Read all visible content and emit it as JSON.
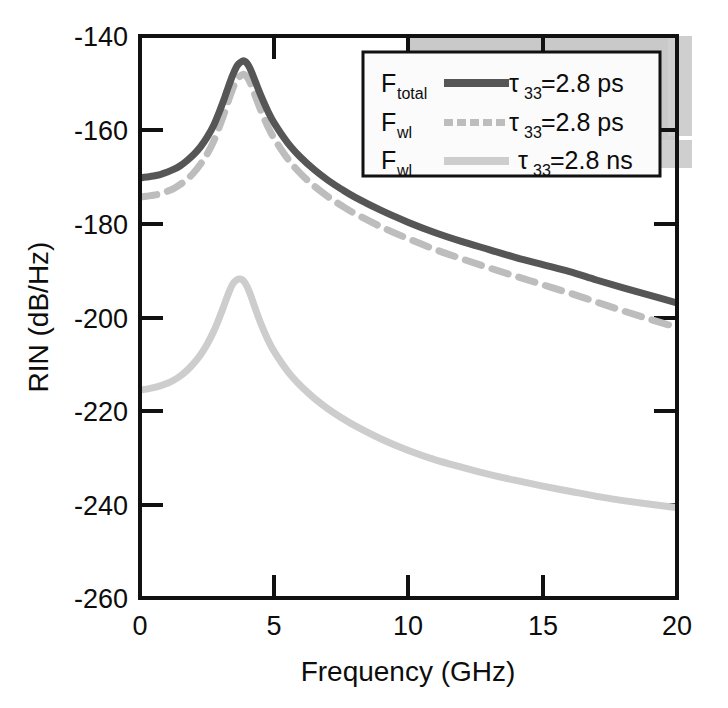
{
  "chart_data": {
    "type": "line",
    "title": "",
    "xlabel": "Frequency (GHz)",
    "ylabel": "RIN (dB/Hz)",
    "xlim": [
      0,
      20
    ],
    "ylim": [
      -260,
      -140
    ],
    "xticks": [
      "0",
      "5",
      "10",
      "15",
      "20"
    ],
    "xtick_values": [
      0,
      5,
      10,
      15,
      20
    ],
    "yticks": [
      "-140",
      "-160",
      "-180",
      "-200",
      "-220",
      "-240",
      "-260"
    ],
    "ytick_values": [
      -140,
      -160,
      -180,
      -200,
      -220,
      -240,
      -260
    ],
    "grid": false,
    "legend_position": "upper-right-inside",
    "series": [
      {
        "name": "F_total, tau33 = 2.8 ps",
        "legend_symbol": "F",
        "legend_subscript": "total",
        "legend_value_prefix": "τ",
        "legend_value_subscript": "33",
        "legend_value": "=2.8 ps",
        "style": "solid",
        "color": "#565656",
        "width": 7,
        "x": [
          0,
          0.25,
          0.5,
          0.75,
          1.0,
          1.25,
          1.5,
          1.75,
          2.0,
          2.25,
          2.5,
          2.75,
          3.0,
          3.15,
          3.3,
          3.45,
          3.6,
          3.7,
          3.8,
          3.87,
          3.95,
          4.05,
          4.15,
          4.3,
          4.5,
          4.75,
          5.0,
          5.5,
          6.0,
          6.5,
          7.0,
          7.5,
          8.0,
          9.0,
          10.0,
          11.0,
          12.0,
          13.0,
          14.0,
          15.0,
          16.0,
          17.0,
          18.0,
          19.0,
          20.0
        ],
        "y": [
          -170.3,
          -170.1,
          -169.9,
          -169.6,
          -169.1,
          -168.5,
          -167.7,
          -166.6,
          -165.3,
          -163.7,
          -161.6,
          -159.0,
          -155.5,
          -153.2,
          -150.7,
          -148.4,
          -146.5,
          -145.8,
          -145.4,
          -145.3,
          -145.6,
          -146.4,
          -147.6,
          -149.8,
          -152.7,
          -155.9,
          -158.6,
          -162.8,
          -166.0,
          -168.6,
          -170.8,
          -172.7,
          -174.4,
          -177.3,
          -179.8,
          -182.0,
          -183.9,
          -185.6,
          -187.3,
          -188.8,
          -190.3,
          -192.1,
          -193.8,
          -195.4,
          -197.0
        ]
      },
      {
        "name": "F_wl, tau33 = 2.8 ps",
        "legend_symbol": "F",
        "legend_subscript": "wl",
        "legend_value_prefix": "τ",
        "legend_value_subscript": "33",
        "legend_value": "=2.8 ps",
        "style": "dashed",
        "color": "#bdbdbd",
        "width": 7,
        "x": [
          0,
          0.25,
          0.5,
          0.75,
          1.0,
          1.25,
          1.5,
          1.75,
          2.0,
          2.25,
          2.5,
          2.75,
          3.0,
          3.15,
          3.3,
          3.45,
          3.6,
          3.7,
          3.8,
          3.87,
          3.95,
          4.05,
          4.15,
          4.3,
          4.5,
          4.75,
          5.0,
          5.5,
          6.0,
          6.5,
          7.0,
          7.5,
          8.0,
          9.0,
          10.0,
          11.0,
          12.0,
          13.0,
          14.0,
          15.0,
          16.0,
          17.0,
          18.0,
          19.0,
          20.0
        ],
        "y": [
          -174.4,
          -174.2,
          -174.0,
          -173.7,
          -173.2,
          -172.6,
          -171.7,
          -170.6,
          -169.2,
          -167.4,
          -165.2,
          -162.4,
          -158.7,
          -156.3,
          -153.7,
          -151.3,
          -149.4,
          -148.7,
          -148.3,
          -148.2,
          -148.5,
          -149.3,
          -150.6,
          -152.9,
          -155.9,
          -159.2,
          -161.9,
          -166.2,
          -169.5,
          -172.1,
          -174.3,
          -176.2,
          -177.9,
          -180.8,
          -183.3,
          -185.6,
          -187.6,
          -189.5,
          -191.3,
          -193.1,
          -194.9,
          -196.8,
          -198.7,
          -200.5,
          -202.2
        ]
      },
      {
        "name": "F_wl, tau33 = 2.8 ns",
        "legend_symbol": "F",
        "legend_subscript": "wl",
        "legend_value_prefix": "τ",
        "legend_value_subscript": "33",
        "legend_value": "=2.8 ns",
        "style": "solid",
        "color": "#cdcdcd",
        "width": 7,
        "x": [
          0,
          0.25,
          0.5,
          0.75,
          1.0,
          1.25,
          1.5,
          1.75,
          2.0,
          2.25,
          2.5,
          2.75,
          3.0,
          3.15,
          3.3,
          3.45,
          3.6,
          3.7,
          3.8,
          3.87,
          3.95,
          4.05,
          4.15,
          4.3,
          4.5,
          4.75,
          5.0,
          5.5,
          6.0,
          6.5,
          7.0,
          7.5,
          8.0,
          9.0,
          10.0,
          11.0,
          12.0,
          13.0,
          14.0,
          15.0,
          16.0,
          17.0,
          18.0,
          19.0,
          20.0
        ],
        "y": [
          -215.6,
          -215.4,
          -215.1,
          -214.7,
          -214.2,
          -213.5,
          -212.6,
          -211.4,
          -209.9,
          -208.1,
          -205.8,
          -203.0,
          -199.5,
          -197.2,
          -194.9,
          -193.0,
          -192.1,
          -191.9,
          -192.0,
          -192.4,
          -193.1,
          -194.3,
          -195.8,
          -198.3,
          -201.4,
          -204.7,
          -207.4,
          -211.6,
          -214.8,
          -217.4,
          -219.6,
          -221.5,
          -223.2,
          -226.1,
          -228.5,
          -230.5,
          -232.1,
          -233.6,
          -234.9,
          -236.1,
          -237.2,
          -238.3,
          -239.2,
          -240.0,
          -240.7
        ]
      }
    ]
  },
  "axes": {
    "y_axis_title": "RIN (dB/Hz)",
    "x_axis_title": "Frequency (GHz)"
  },
  "legend": {
    "rows": [
      {
        "symbol": "F",
        "subscript": "total",
        "tau": "τ",
        "tau_sub": "33",
        "value": "=2.8 ps",
        "line_style": "solid",
        "line_color": "#565656"
      },
      {
        "symbol": "F",
        "subscript": "wl",
        "tau": "τ",
        "tau_sub": "33",
        "value": "=2.8 ps",
        "line_style": "dotted",
        "line_color": "#bdbdbd"
      },
      {
        "symbol": "F",
        "subscript": "wl",
        "tau": "τ",
        "tau_sub": "33",
        "value": "=2.8 ns",
        "line_style": "solid",
        "line_color": "#cdcdcd"
      }
    ]
  }
}
